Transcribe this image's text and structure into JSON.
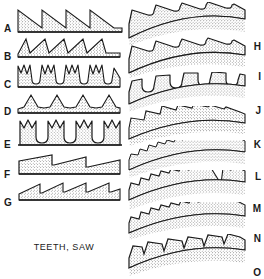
{
  "plate": {
    "caption": "TEETH, SAW",
    "width": 264,
    "height": 279,
    "background_color": "#ffffff",
    "ink_color": "#1a1a1a",
    "stipple_color": "#3a3a3a"
  },
  "left_column": {
    "description": "Straight saw blade tooth profiles",
    "figures": [
      {
        "label": "A",
        "name": "rip-tooth-straight",
        "tooth_count": 4,
        "profile": "large right-triangle rip teeth, vertical front face, long straight back ramp",
        "y": 6,
        "label_y": 24,
        "height": 30
      },
      {
        "label": "B",
        "name": "crosscut-tooth-straight",
        "tooth_count": 5,
        "profile": "medium raked teeth, sloped front face, concave gullet",
        "y": 36,
        "label_y": 52,
        "height": 27
      },
      {
        "label": "C",
        "name": "deep-gullet-tooth",
        "tooth_count": 4,
        "profile": "paired points with deep narrow parallel-sided gullets between",
        "y": 62,
        "label_y": 80,
        "height": 30
      },
      {
        "label": "D",
        "name": "peg-tooth-straight",
        "tooth_count": 5,
        "profile": "small symmetric triangular peg teeth on shallow gullets",
        "y": 92,
        "label_y": 107,
        "height": 27
      },
      {
        "label": "E",
        "name": "notched-crown-tooth",
        "tooth_count": 4,
        "profile": "tall parallel-sided teeth with M-notched crowns and rounded gullets",
        "y": 118,
        "label_y": 140,
        "height": 33
      },
      {
        "label": "F",
        "name": "coarse-rip-tooth",
        "tooth_count": 3,
        "profile": "very coarse widely spaced teeth with long shallow ramps",
        "y": 152,
        "label_y": 170,
        "height": 28
      },
      {
        "label": "G",
        "name": "fine-rip-tooth",
        "tooth_count": 4,
        "profile": "fine raked teeth with steep front faces and short ramps",
        "y": 180,
        "label_y": 198,
        "height": 28
      }
    ]
  },
  "right_column": {
    "description": "Curved (arc) saw blade tooth profiles",
    "figures": [
      {
        "label": "H",
        "name": "curved-hook-tooth",
        "tooth_count": 4,
        "profile": "curved blade with large hooked teeth and deep rounded gullets",
        "y": 2,
        "label_y": 42,
        "height": 44,
        "curve": 14
      },
      {
        "label": "I",
        "name": "curved-raker-tooth",
        "tooth_count": 4,
        "profile": "curved blade, hooked teeth with wide gullets, slightly finer pitch",
        "y": 36,
        "label_y": 72,
        "height": 42,
        "curve": 14
      },
      {
        "label": "J",
        "name": "curved-square-crown-tooth",
        "tooth_count": 5,
        "profile": "curved blade with square flat-topped crown teeth and round gullets",
        "y": 72,
        "label_y": 106,
        "height": 40,
        "curve": 13
      },
      {
        "label": "K",
        "name": "curved-sloped-tooth",
        "tooth_count": 7,
        "profile": "curved blade with medium raked triangular teeth",
        "y": 106,
        "label_y": 140,
        "height": 40,
        "curve": 13
      },
      {
        "label": "L",
        "name": "curved-fine-tooth",
        "tooth_count": 13,
        "profile": "curved blade with very fine close-pitched saw teeth",
        "y": 140,
        "label_y": 172,
        "height": 38,
        "curve": 12
      },
      {
        "label": "M",
        "name": "curved-tooth-with-raker-gap",
        "tooth_count": 8,
        "profile": "curved blade with fine teeth interrupted by a large gullet notch",
        "y": 170,
        "label_y": 204,
        "height": 40,
        "curve": 12
      },
      {
        "label": "N",
        "name": "curved-peg-tooth",
        "tooth_count": 11,
        "profile": "curved blade with small uniform peg teeth",
        "y": 202,
        "label_y": 234,
        "height": 38,
        "curve": 12
      },
      {
        "label": "O",
        "name": "curved-claw-tooth",
        "tooth_count": 6,
        "profile": "curved blade with broad claw-shaped hooked teeth",
        "y": 234,
        "label_y": 268,
        "height": 42,
        "curve": 12
      }
    ]
  }
}
